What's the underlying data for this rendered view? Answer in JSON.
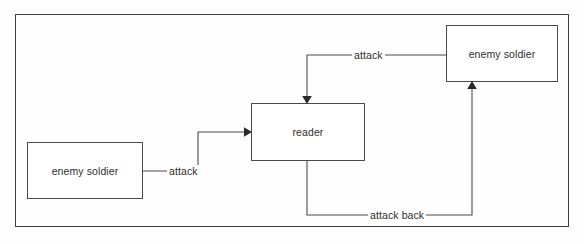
{
  "diagram": {
    "type": "sequence-interaction-diagram",
    "frame": {
      "x": 15,
      "y": 14,
      "width": 554,
      "height": 213
    },
    "stroke_color": "#4a4a4a",
    "text_color": "#2e2e2e",
    "background_color": "#ffffff",
    "nodes": [
      {
        "id": "enemy-soldier-left",
        "label": "enemy soldier",
        "x": 27,
        "y": 142,
        "width": 116,
        "height": 57
      },
      {
        "id": "reader",
        "label": "reader",
        "x": 251,
        "y": 103,
        "width": 114,
        "height": 58
      },
      {
        "id": "enemy-soldier-right",
        "label": "enemy soldier",
        "x": 446,
        "y": 25,
        "width": 112,
        "height": 57
      }
    ],
    "edges": [
      {
        "id": "edge-left-attack",
        "label": "attack",
        "from": "enemy-soldier-left",
        "to": "reader",
        "label_x": 167,
        "label_y": 165,
        "path": "M 143 171 L 198 171 L 198 132 L 244 132",
        "arrow": "right",
        "arrow_x": 251,
        "arrow_y": 132
      },
      {
        "id": "edge-top-attack",
        "label": "attack",
        "from": "enemy-soldier-right",
        "to": "reader",
        "label_x": 352,
        "label_y": 49,
        "path": "M 446 55 L 307 55 L 307 96",
        "arrow": "down",
        "arrow_x": 307,
        "arrow_y": 103
      },
      {
        "id": "edge-attack-back",
        "label": "attack back",
        "from": "reader",
        "to": "enemy-soldier-right",
        "label_x": 368,
        "label_y": 209,
        "path": "M 307 161 L 307 215 L 472 215 L 472 89",
        "arrow": "up",
        "arrow_x": 472,
        "arrow_y": 82
      }
    ]
  }
}
